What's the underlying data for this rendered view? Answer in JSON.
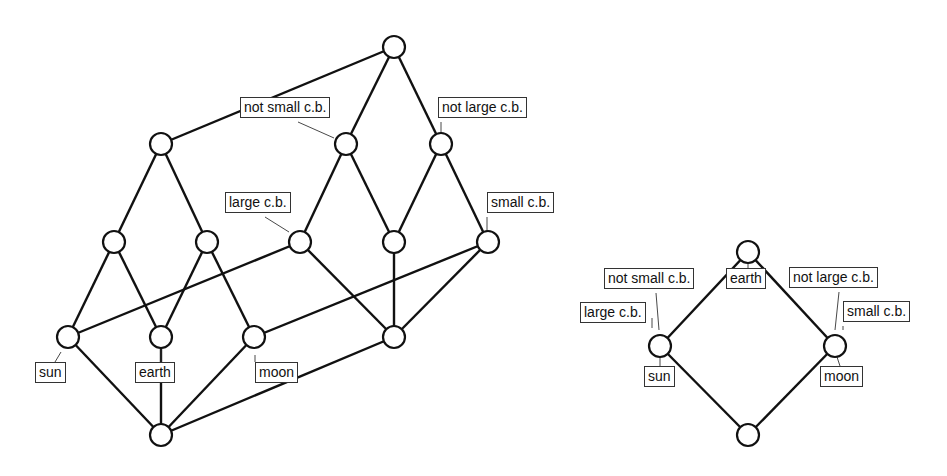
{
  "colors": {
    "stroke": "#111111",
    "background": "#ffffff",
    "label_border": "#333333"
  },
  "node_radius": 11,
  "diagrams": [
    {
      "id": "left-lattice",
      "nodes": [
        {
          "id": "top",
          "x": 394,
          "y": 47
        },
        {
          "id": "n_a",
          "x": 161,
          "y": 144
        },
        {
          "id": "n_b",
          "x": 346,
          "y": 144
        },
        {
          "id": "n_c",
          "x": 441,
          "y": 144
        },
        {
          "id": "n_d",
          "x": 114,
          "y": 242
        },
        {
          "id": "n_e",
          "x": 207,
          "y": 242
        },
        {
          "id": "n_f",
          "x": 300,
          "y": 242
        },
        {
          "id": "n_g",
          "x": 394,
          "y": 242
        },
        {
          "id": "n_h",
          "x": 488,
          "y": 242
        },
        {
          "id": "n_i",
          "x": 68,
          "y": 337
        },
        {
          "id": "n_j",
          "x": 161,
          "y": 337
        },
        {
          "id": "n_k",
          "x": 254,
          "y": 337
        },
        {
          "id": "n_l",
          "x": 394,
          "y": 337
        },
        {
          "id": "bottom",
          "x": 161,
          "y": 435
        }
      ],
      "edges": [
        [
          "top",
          "n_a"
        ],
        [
          "top",
          "n_b"
        ],
        [
          "top",
          "n_c"
        ],
        [
          "n_a",
          "n_d"
        ],
        [
          "n_a",
          "n_e"
        ],
        [
          "n_b",
          "n_f"
        ],
        [
          "n_b",
          "n_g"
        ],
        [
          "n_c",
          "n_g"
        ],
        [
          "n_c",
          "n_h"
        ],
        [
          "n_d",
          "n_i"
        ],
        [
          "n_d",
          "n_j"
        ],
        [
          "n_e",
          "n_j"
        ],
        [
          "n_e",
          "n_k"
        ],
        [
          "n_f",
          "n_i"
        ],
        [
          "n_f",
          "n_l"
        ],
        [
          "n_g",
          "n_l"
        ],
        [
          "n_h",
          "n_k"
        ],
        [
          "n_h",
          "n_l"
        ],
        [
          "n_i",
          "bottom"
        ],
        [
          "n_j",
          "bottom"
        ],
        [
          "n_k",
          "bottom"
        ],
        [
          "n_l",
          "bottom"
        ]
      ],
      "labels": [
        {
          "text": "not small c.b.",
          "x": 240,
          "y": 97,
          "node": "n_b",
          "lx1": 298,
          "ly1": 122,
          "lx2": 334,
          "ly2": 138
        },
        {
          "text": "not large c.b.",
          "x": 438,
          "y": 97,
          "node": "n_c",
          "lx1": 441,
          "ly1": 122,
          "lx2": 441,
          "ly2": 133
        },
        {
          "text": "large c.b.",
          "x": 225,
          "y": 192,
          "node": "n_f",
          "lx1": 265,
          "ly1": 217,
          "lx2": 289,
          "ly2": 232
        },
        {
          "text": "small c.b.",
          "x": 487,
          "y": 192,
          "node": "n_h",
          "lx1": 487,
          "ly1": 217,
          "lx2": 487,
          "ly2": 231
        },
        {
          "text": "sun",
          "x": 35,
          "y": 362,
          "node": "n_i",
          "lx1": 55,
          "ly1": 362,
          "lx2": 61,
          "ly2": 352
        },
        {
          "text": "earth",
          "x": 135,
          "y": 362,
          "node": "n_j",
          "lx1": 161,
          "ly1": 348,
          "lx2": 161,
          "ly2": 362
        },
        {
          "text": "moon",
          "x": 255,
          "y": 362,
          "node": "n_k",
          "lx1": 255,
          "ly1": 362,
          "lx2": 255,
          "ly2": 355
        }
      ]
    },
    {
      "id": "right-lattice",
      "nodes": [
        {
          "id": "top",
          "x": 748,
          "y": 252
        },
        {
          "id": "left",
          "x": 660,
          "y": 346
        },
        {
          "id": "right",
          "x": 835,
          "y": 346
        },
        {
          "id": "bottom",
          "x": 748,
          "y": 435
        }
      ],
      "edges": [
        [
          "top",
          "left"
        ],
        [
          "top",
          "right"
        ],
        [
          "left",
          "bottom"
        ],
        [
          "right",
          "bottom"
        ]
      ],
      "labels": [
        {
          "text": "not small c.b.",
          "x": 604,
          "y": 268,
          "node": "left",
          "lx1": 656,
          "ly1": 293,
          "lx2": 659,
          "ly2": 330
        },
        {
          "text": "large c.b.",
          "x": 580,
          "y": 302,
          "node": "left",
          "lx1": 652,
          "ly1": 318,
          "lx2": 652,
          "ly2": 328
        },
        {
          "text": "earth",
          "x": 726,
          "y": 268,
          "node": "top",
          "lx1": 748,
          "ly1": 263,
          "lx2": 748,
          "ly2": 268
        },
        {
          "text": "sun",
          "x": 644,
          "y": 366,
          "node": "left",
          "lx1": 660,
          "ly1": 357,
          "lx2": 660,
          "ly2": 366
        },
        {
          "text": "not large c.b.",
          "x": 789,
          "y": 267,
          "node": "right",
          "lx1": 839,
          "ly1": 292,
          "lx2": 835,
          "ly2": 330
        },
        {
          "text": "small c.b.",
          "x": 843,
          "y": 301,
          "node": "right",
          "lx1": 843,
          "ly1": 326,
          "lx2": 843,
          "ly2": 330
        },
        {
          "text": "moon",
          "x": 820,
          "y": 366,
          "node": "right",
          "lx1": 837,
          "ly1": 357,
          "lx2": 840,
          "ly2": 366
        }
      ]
    }
  ]
}
